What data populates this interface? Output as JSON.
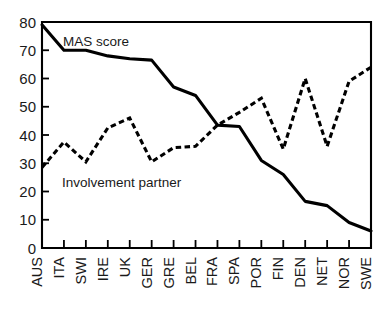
{
  "chart_data": {
    "type": "line",
    "title": "",
    "subtitle": "",
    "xlabel": "",
    "ylabel": "",
    "xlim": [
      0,
      15
    ],
    "ylim": [
      0,
      80
    ],
    "yticks": [
      0,
      10,
      20,
      30,
      40,
      50,
      60,
      70,
      80
    ],
    "ytick_labels": [
      "0",
      "10",
      "20",
      "30",
      "40",
      "50",
      "60",
      "70",
      "80"
    ],
    "grid": false,
    "legend": "inline-annotations",
    "categories": [
      "AUS",
      "ITA",
      "SWI",
      "IRE",
      "UK",
      "GER",
      "GRE",
      "BEL",
      "FRA",
      "SPA",
      "POR",
      "FIN",
      "DEN",
      "NET",
      "NOR",
      "SWE"
    ],
    "series": [
      {
        "name": "MAS score",
        "style": "solid",
        "annotation": "MAS score",
        "values": [
          79,
          70,
          70,
          68,
          67,
          66.5,
          57,
          54,
          43.5,
          43,
          31,
          26,
          16.5,
          15,
          9,
          6
        ]
      },
      {
        "name": "Involvement partner",
        "style": "dashed",
        "annotation": "Involvement partner",
        "values": [
          28.5,
          37.5,
          30.5,
          42.5,
          46,
          30.5,
          35.5,
          36,
          43.5,
          48,
          53,
          35,
          60,
          36,
          59,
          64
        ]
      }
    ],
    "annotations": [
      {
        "text": "MAS score",
        "x_px": 63,
        "y_px": 46
      },
      {
        "text": "Involvement partner",
        "x_px": 62,
        "y_px": 187
      }
    ]
  },
  "axes": {
    "y_axis_name": "value-axis",
    "x_axis_name": "category-axis"
  }
}
